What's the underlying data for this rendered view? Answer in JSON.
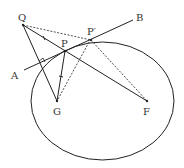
{
  "diagram": {
    "points": {
      "Q": {
        "label": "Q",
        "x": 23,
        "y": 25
      },
      "P": {
        "label": "P",
        "x": 65,
        "y": 51
      },
      "P_prime": {
        "label": "P′",
        "x": 91,
        "y": 40
      },
      "A": {
        "label": "A",
        "x": 24,
        "y": 70
      },
      "B": {
        "label": "B",
        "x": 133,
        "y": 20
      },
      "G": {
        "label": "G",
        "x": 57,
        "y": 101
      },
      "F": {
        "label": "F",
        "x": 147,
        "y": 101
      }
    },
    "ellipse": {
      "cx": 102.5,
      "cy": 101,
      "rx": 71.5,
      "ry": 59
    },
    "solid_segments": [
      "Q-F",
      "Q-G",
      "P-G",
      "A-B"
    ],
    "dashed_segments": [
      "Q-P'",
      "P'-F",
      "P'-G"
    ],
    "marks": [
      "right-angle at Q-G / A-B intersection",
      "tick on Q-P",
      "tick on P-G"
    ]
  },
  "labels": {
    "Q": "Q",
    "P": "P",
    "P_prime": "P′",
    "A": "A",
    "B": "B",
    "G": "G",
    "F": "F"
  }
}
